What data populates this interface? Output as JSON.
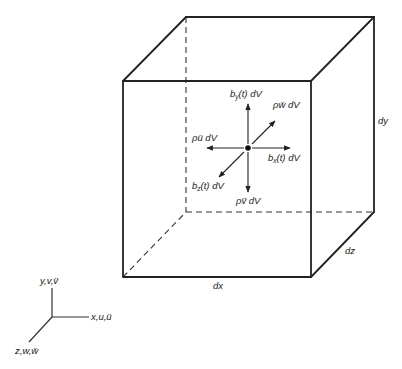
{
  "diagram": {
    "cube": {
      "front": {
        "tl": [
          123,
          81
        ],
        "tr": [
          311,
          81
        ],
        "br": [
          311,
          277
        ],
        "bl": [
          123,
          277
        ]
      },
      "back": {
        "tl": [
          186,
          17
        ],
        "tr": [
          374,
          17
        ],
        "br": [
          374,
          212
        ],
        "bl": [
          186,
          212
        ]
      }
    },
    "dimension_labels": {
      "dx": "dx",
      "dy": "dy",
      "dz": "dz"
    },
    "center_point": [
      248,
      148
    ],
    "force_labels": {
      "by": "bᵧ(t) dV",
      "bx": "bₓ(t) dV",
      "bz": "b_z(t) dV",
      "rho_u": "ρü dV",
      "rho_v": "ρv̈ dV",
      "rho_w": "ρẅ dV"
    },
    "force_label_parts": {
      "by": {
        "base": "b",
        "sub": "y",
        "rest": "(t) dV"
      },
      "bx": {
        "base": "b",
        "sub": "x",
        "rest": "(t) dV"
      },
      "bz": {
        "base": "b",
        "sub": "z",
        "rest": "(t) dV"
      },
      "rho_u": "ρü dV",
      "rho_v": "ρv̈ dV",
      "rho_w": "ρẅ dV"
    },
    "axes": {
      "origin": [
        52,
        317
      ],
      "y_label": "y,v,v̈",
      "x_label": "x,u,ü",
      "z_label": "z,w,ẅ"
    },
    "colors": {
      "line": "#222222",
      "background": "#ffffff"
    }
  }
}
